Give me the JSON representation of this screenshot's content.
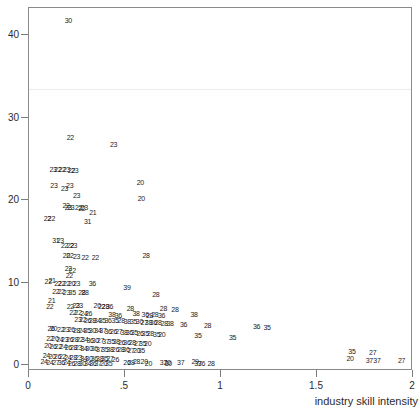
{
  "chart_data": {
    "type": "scatter",
    "title": "",
    "xlabel": "industry skill intensity",
    "ylabel": "",
    "xlim": [
      0,
      2.0
    ],
    "ylim": [
      0,
      44
    ],
    "grid": false,
    "legend": null,
    "marker_style": "two-digit industry code label",
    "xticks": [
      {
        "value": 0,
        "label": "0"
      },
      {
        "value": 0.5,
        "label": ".5"
      },
      {
        "value": 1.0,
        "label": "1"
      },
      {
        "value": 1.5,
        "label": "1.5"
      },
      {
        "value": 2.0,
        "label": "2"
      }
    ],
    "yticks": [
      {
        "value": 0,
        "label": "0"
      },
      {
        "value": 10,
        "label": "10"
      },
      {
        "value": 20,
        "label": "20"
      },
      {
        "value": 30,
        "label": "30"
      },
      {
        "value": 40,
        "label": "40"
      }
    ],
    "points": [
      {
        "x": 0.205,
        "y": 41.8,
        "label": "30"
      },
      {
        "x": 0.215,
        "y": 27.6,
        "label": "22"
      },
      {
        "x": 0.44,
        "y": 26.8,
        "label": "23"
      },
      {
        "x": 0.125,
        "y": 23.7,
        "label": "23"
      },
      {
        "x": 0.15,
        "y": 23.7,
        "label": "22"
      },
      {
        "x": 0.172,
        "y": 23.7,
        "label": "22"
      },
      {
        "x": 0.196,
        "y": 23.7,
        "label": "23"
      },
      {
        "x": 0.221,
        "y": 23.6,
        "label": "22"
      },
      {
        "x": 0.238,
        "y": 23.6,
        "label": "23"
      },
      {
        "x": 0.13,
        "y": 21.8,
        "label": "23"
      },
      {
        "x": 0.185,
        "y": 21.4,
        "label": "23"
      },
      {
        "x": 0.212,
        "y": 21.8,
        "label": "23"
      },
      {
        "x": 0.58,
        "y": 22.2,
        "label": "20"
      },
      {
        "x": 0.248,
        "y": 20.6,
        "label": "23"
      },
      {
        "x": 0.585,
        "y": 20.2,
        "label": "20"
      },
      {
        "x": 0.193,
        "y": 19.4,
        "label": "22"
      },
      {
        "x": 0.205,
        "y": 19.1,
        "label": "23"
      },
      {
        "x": 0.218,
        "y": 19.1,
        "label": "23"
      },
      {
        "x": 0.258,
        "y": 19.2,
        "label": "22"
      },
      {
        "x": 0.275,
        "y": 19.0,
        "label": "22"
      },
      {
        "x": 0.288,
        "y": 19.1,
        "label": "23"
      },
      {
        "x": 0.332,
        "y": 18.6,
        "label": "21"
      },
      {
        "x": 0.095,
        "y": 17.8,
        "label": "22"
      },
      {
        "x": 0.117,
        "y": 17.8,
        "label": "22"
      },
      {
        "x": 0.305,
        "y": 17.4,
        "label": "31"
      },
      {
        "x": 0.14,
        "y": 15.2,
        "label": "31"
      },
      {
        "x": 0.163,
        "y": 15.2,
        "label": "23"
      },
      {
        "x": 0.185,
        "y": 14.6,
        "label": "22"
      },
      {
        "x": 0.215,
        "y": 14.6,
        "label": "22"
      },
      {
        "x": 0.232,
        "y": 14.6,
        "label": "23"
      },
      {
        "x": 0.195,
        "y": 13.3,
        "label": "20"
      },
      {
        "x": 0.213,
        "y": 13.3,
        "label": "22"
      },
      {
        "x": 0.248,
        "y": 13.2,
        "label": "23"
      },
      {
        "x": 0.292,
        "y": 13.1,
        "label": "22"
      },
      {
        "x": 0.345,
        "y": 13.1,
        "label": "22"
      },
      {
        "x": 0.61,
        "y": 13.3,
        "label": "28"
      },
      {
        "x": 0.205,
        "y": 11.8,
        "label": "22"
      },
      {
        "x": 0.225,
        "y": 11.5,
        "label": "22"
      },
      {
        "x": 0.21,
        "y": 10.9,
        "label": "22"
      },
      {
        "x": 0.1,
        "y": 10.2,
        "label": "22"
      },
      {
        "x": 0.12,
        "y": 10.3,
        "label": "21"
      },
      {
        "x": 0.15,
        "y": 10.0,
        "label": "22"
      },
      {
        "x": 0.17,
        "y": 10.0,
        "label": "22"
      },
      {
        "x": 0.196,
        "y": 10.0,
        "label": "22"
      },
      {
        "x": 0.222,
        "y": 10.0,
        "label": "20"
      },
      {
        "x": 0.248,
        "y": 9.9,
        "label": "23"
      },
      {
        "x": 0.33,
        "y": 9.9,
        "label": "36"
      },
      {
        "x": 0.51,
        "y": 9.4,
        "label": "39"
      },
      {
        "x": 0.14,
        "y": 9.0,
        "label": "22"
      },
      {
        "x": 0.168,
        "y": 9.0,
        "label": "22"
      },
      {
        "x": 0.195,
        "y": 8.9,
        "label": "23"
      },
      {
        "x": 0.225,
        "y": 8.9,
        "label": "35"
      },
      {
        "x": 0.275,
        "y": 8.8,
        "label": "28"
      },
      {
        "x": 0.292,
        "y": 8.8,
        "label": "28"
      },
      {
        "x": 0.66,
        "y": 8.6,
        "label": "28"
      },
      {
        "x": 0.118,
        "y": 7.9,
        "label": "21"
      },
      {
        "x": 0.108,
        "y": 7.2,
        "label": "22"
      },
      {
        "x": 0.215,
        "y": 7.2,
        "label": "22"
      },
      {
        "x": 0.245,
        "y": 7.3,
        "label": "23"
      },
      {
        "x": 0.262,
        "y": 7.3,
        "label": "23"
      },
      {
        "x": 0.355,
        "y": 7.3,
        "label": "20"
      },
      {
        "x": 0.378,
        "y": 7.2,
        "label": "22"
      },
      {
        "x": 0.398,
        "y": 7.2,
        "label": "28"
      },
      {
        "x": 0.42,
        "y": 7.1,
        "label": "36"
      },
      {
        "x": 0.528,
        "y": 6.9,
        "label": "28"
      },
      {
        "x": 0.7,
        "y": 6.9,
        "label": "28"
      },
      {
        "x": 0.76,
        "y": 6.8,
        "label": "28"
      },
      {
        "x": 0.228,
        "y": 6.4,
        "label": "22"
      },
      {
        "x": 0.256,
        "y": 6.4,
        "label": "22"
      },
      {
        "x": 0.286,
        "y": 6.3,
        "label": "24"
      },
      {
        "x": 0.31,
        "y": 6.3,
        "label": "26"
      },
      {
        "x": 0.432,
        "y": 6.2,
        "label": "38"
      },
      {
        "x": 0.465,
        "y": 6.1,
        "label": "36"
      },
      {
        "x": 0.558,
        "y": 6.3,
        "label": "38"
      },
      {
        "x": 0.605,
        "y": 6.2,
        "label": "36"
      },
      {
        "x": 0.628,
        "y": 6.1,
        "label": "28"
      },
      {
        "x": 0.655,
        "y": 6.2,
        "label": "28"
      },
      {
        "x": 0.69,
        "y": 6.1,
        "label": "36"
      },
      {
        "x": 0.86,
        "y": 6.2,
        "label": "38"
      },
      {
        "x": 0.255,
        "y": 5.6,
        "label": "23"
      },
      {
        "x": 0.28,
        "y": 5.6,
        "label": "22"
      },
      {
        "x": 0.305,
        "y": 5.5,
        "label": "26"
      },
      {
        "x": 0.33,
        "y": 5.5,
        "label": "28"
      },
      {
        "x": 0.356,
        "y": 5.5,
        "label": "34"
      },
      {
        "x": 0.382,
        "y": 5.4,
        "label": "35"
      },
      {
        "x": 0.412,
        "y": 5.4,
        "label": "36"
      },
      {
        "x": 0.448,
        "y": 5.4,
        "label": "35"
      },
      {
        "x": 0.48,
        "y": 5.4,
        "label": "28"
      },
      {
        "x": 0.512,
        "y": 5.3,
        "label": "38"
      },
      {
        "x": 0.545,
        "y": 5.3,
        "label": "35"
      },
      {
        "x": 0.575,
        "y": 5.3,
        "label": "30"
      },
      {
        "x": 0.6,
        "y": 5.2,
        "label": "27"
      },
      {
        "x": 0.622,
        "y": 5.2,
        "label": "38"
      },
      {
        "x": 0.648,
        "y": 5.2,
        "label": "36"
      },
      {
        "x": 0.672,
        "y": 5.2,
        "label": "28"
      },
      {
        "x": 0.705,
        "y": 5.1,
        "label": "28"
      },
      {
        "x": 0.735,
        "y": 5.1,
        "label": "38"
      },
      {
        "x": 0.805,
        "y": 5.0,
        "label": "36"
      },
      {
        "x": 0.93,
        "y": 4.8,
        "label": "28"
      },
      {
        "x": 1.185,
        "y": 4.7,
        "label": "36"
      },
      {
        "x": 1.24,
        "y": 4.6,
        "label": "35"
      },
      {
        "x": 0.115,
        "y": 4.5,
        "label": "26"
      },
      {
        "x": 0.128,
        "y": 4.5,
        "label": "20"
      },
      {
        "x": 0.165,
        "y": 4.4,
        "label": "22"
      },
      {
        "x": 0.192,
        "y": 4.4,
        "label": "23"
      },
      {
        "x": 0.22,
        "y": 4.4,
        "label": "26"
      },
      {
        "x": 0.248,
        "y": 4.3,
        "label": "28"
      },
      {
        "x": 0.276,
        "y": 4.3,
        "label": "24"
      },
      {
        "x": 0.302,
        "y": 4.3,
        "label": "35"
      },
      {
        "x": 0.33,
        "y": 4.2,
        "label": "30"
      },
      {
        "x": 0.358,
        "y": 4.2,
        "label": "34"
      },
      {
        "x": 0.385,
        "y": 4.2,
        "label": "37"
      },
      {
        "x": 0.412,
        "y": 4.1,
        "label": "36"
      },
      {
        "x": 0.44,
        "y": 4.1,
        "label": "26"
      },
      {
        "x": 0.468,
        "y": 4.1,
        "label": "27"
      },
      {
        "x": 0.495,
        "y": 4.0,
        "label": "38"
      },
      {
        "x": 0.522,
        "y": 4.0,
        "label": "36"
      },
      {
        "x": 0.548,
        "y": 4.0,
        "label": "35"
      },
      {
        "x": 0.578,
        "y": 3.9,
        "label": "26"
      },
      {
        "x": 0.605,
        "y": 3.9,
        "label": "35"
      },
      {
        "x": 0.632,
        "y": 3.9,
        "label": "28"
      },
      {
        "x": 0.665,
        "y": 3.8,
        "label": "35"
      },
      {
        "x": 0.692,
        "y": 3.8,
        "label": "20"
      },
      {
        "x": 0.88,
        "y": 3.6,
        "label": "35"
      },
      {
        "x": 1.06,
        "y": 3.4,
        "label": "35"
      },
      {
        "x": 0.108,
        "y": 3.3,
        "label": "22"
      },
      {
        "x": 0.135,
        "y": 3.3,
        "label": "20"
      },
      {
        "x": 0.16,
        "y": 3.2,
        "label": "24"
      },
      {
        "x": 0.186,
        "y": 3.2,
        "label": "23"
      },
      {
        "x": 0.212,
        "y": 3.2,
        "label": "26"
      },
      {
        "x": 0.238,
        "y": 3.1,
        "label": "28"
      },
      {
        "x": 0.265,
        "y": 3.1,
        "label": "22"
      },
      {
        "x": 0.29,
        "y": 3.1,
        "label": "34"
      },
      {
        "x": 0.318,
        "y": 3.0,
        "label": "36"
      },
      {
        "x": 0.345,
        "y": 3.0,
        "label": "30"
      },
      {
        "x": 0.372,
        "y": 3.0,
        "label": "27"
      },
      {
        "x": 0.4,
        "y": 2.9,
        "label": "37"
      },
      {
        "x": 0.428,
        "y": 2.9,
        "label": "35"
      },
      {
        "x": 0.455,
        "y": 2.9,
        "label": "38"
      },
      {
        "x": 0.482,
        "y": 2.8,
        "label": "26"
      },
      {
        "x": 0.51,
        "y": 2.8,
        "label": "36"
      },
      {
        "x": 0.538,
        "y": 2.8,
        "label": "28"
      },
      {
        "x": 0.565,
        "y": 2.7,
        "label": "27"
      },
      {
        "x": 0.592,
        "y": 2.7,
        "label": "35"
      },
      {
        "x": 0.618,
        "y": 2.7,
        "label": "20"
      },
      {
        "x": 0.098,
        "y": 2.4,
        "label": "20"
      },
      {
        "x": 0.125,
        "y": 2.3,
        "label": "26"
      },
      {
        "x": 0.152,
        "y": 2.3,
        "label": "22"
      },
      {
        "x": 0.178,
        "y": 2.3,
        "label": "24"
      },
      {
        "x": 0.205,
        "y": 2.2,
        "label": "26"
      },
      {
        "x": 0.232,
        "y": 2.2,
        "label": "28"
      },
      {
        "x": 0.258,
        "y": 2.2,
        "label": "23"
      },
      {
        "x": 0.285,
        "y": 2.1,
        "label": "34"
      },
      {
        "x": 0.312,
        "y": 2.1,
        "label": "30"
      },
      {
        "x": 0.34,
        "y": 2.1,
        "label": "36"
      },
      {
        "x": 0.368,
        "y": 2.0,
        "label": "37"
      },
      {
        "x": 0.395,
        "y": 2.0,
        "label": "35"
      },
      {
        "x": 0.422,
        "y": 2.0,
        "label": "38"
      },
      {
        "x": 0.45,
        "y": 1.9,
        "label": "26"
      },
      {
        "x": 0.478,
        "y": 1.9,
        "label": "28"
      },
      {
        "x": 0.505,
        "y": 1.9,
        "label": "36"
      },
      {
        "x": 0.532,
        "y": 1.8,
        "label": "27"
      },
      {
        "x": 0.56,
        "y": 1.8,
        "label": "20"
      },
      {
        "x": 0.585,
        "y": 1.8,
        "label": "35"
      },
      {
        "x": 0.09,
        "y": 1.2,
        "label": "24"
      },
      {
        "x": 0.12,
        "y": 1.1,
        "label": "20"
      },
      {
        "x": 0.148,
        "y": 1.1,
        "label": "26"
      },
      {
        "x": 0.175,
        "y": 1.1,
        "label": "22"
      },
      {
        "x": 0.202,
        "y": 1.0,
        "label": "24"
      },
      {
        "x": 0.23,
        "y": 1.0,
        "label": "28"
      },
      {
        "x": 0.258,
        "y": 1.0,
        "label": "23"
      },
      {
        "x": 0.285,
        "y": 0.9,
        "label": "34"
      },
      {
        "x": 0.312,
        "y": 0.9,
        "label": "30"
      },
      {
        "x": 0.34,
        "y": 0.9,
        "label": "36"
      },
      {
        "x": 0.368,
        "y": 0.8,
        "label": "38"
      },
      {
        "x": 0.395,
        "y": 0.8,
        "label": "35"
      },
      {
        "x": 0.422,
        "y": 0.8,
        "label": "27"
      },
      {
        "x": 0.45,
        "y": 0.7,
        "label": "26"
      },
      {
        "x": 0.078,
        "y": 0.5,
        "label": "24"
      },
      {
        "x": 0.108,
        "y": 0.4,
        "label": "24"
      },
      {
        "x": 0.14,
        "y": 0.4,
        "label": "27"
      },
      {
        "x": 0.168,
        "y": 0.4,
        "label": "36"
      },
      {
        "x": 0.196,
        "y": 0.4,
        "label": "24"
      },
      {
        "x": 0.222,
        "y": 0.3,
        "label": "26"
      },
      {
        "x": 0.25,
        "y": 0.3,
        "label": "28"
      },
      {
        "x": 0.278,
        "y": 0.3,
        "label": "30"
      },
      {
        "x": 0.305,
        "y": 0.3,
        "label": "34"
      },
      {
        "x": 0.332,
        "y": 0.3,
        "label": "36"
      },
      {
        "x": 0.36,
        "y": 0.3,
        "label": "37"
      },
      {
        "x": 0.388,
        "y": 0.2,
        "label": "20"
      },
      {
        "x": 0.415,
        "y": 0.2,
        "label": "35"
      },
      {
        "x": 0.51,
        "y": 0.4,
        "label": "26"
      },
      {
        "x": 0.532,
        "y": 0.4,
        "label": "28"
      },
      {
        "x": 0.56,
        "y": 0.5,
        "label": "28"
      },
      {
        "x": 0.6,
        "y": 0.5,
        "label": "20"
      },
      {
        "x": 0.622,
        "y": 0.3,
        "label": "20"
      },
      {
        "x": 0.7,
        "y": 0.4,
        "label": "37"
      },
      {
        "x": 0.72,
        "y": 0.4,
        "label": "20"
      },
      {
        "x": 0.726,
        "y": 0.2,
        "label": "30"
      },
      {
        "x": 0.79,
        "y": 0.4,
        "label": "37"
      },
      {
        "x": 0.865,
        "y": 0.5,
        "label": "29"
      },
      {
        "x": 0.88,
        "y": 0.3,
        "label": "37"
      },
      {
        "x": 0.898,
        "y": 0.3,
        "label": "36"
      },
      {
        "x": 0.948,
        "y": 0.3,
        "label": "28"
      },
      {
        "x": 1.682,
        "y": 1.7,
        "label": "35"
      },
      {
        "x": 1.672,
        "y": 0.9,
        "label": "20"
      },
      {
        "x": 1.79,
        "y": 1.6,
        "label": "27"
      },
      {
        "x": 1.772,
        "y": 0.6,
        "label": "37"
      },
      {
        "x": 1.812,
        "y": 0.6,
        "label": "37"
      },
      {
        "x": 1.94,
        "y": 0.6,
        "label": "27"
      }
    ]
  }
}
